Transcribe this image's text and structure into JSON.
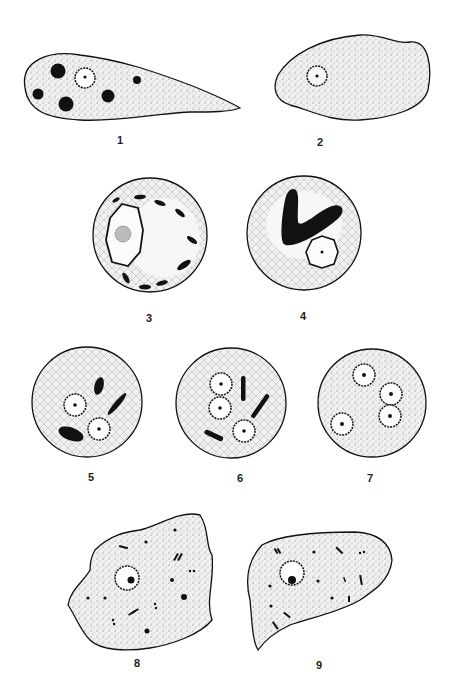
{
  "plate": {
    "type": "scientific illustration plate",
    "figures": [
      {
        "id": 1,
        "label": "1",
        "shape": "elongated amoeba with tapering tail",
        "nucleus": 1,
        "inclusions": "5 dark round bodies"
      },
      {
        "id": 2,
        "label": "2",
        "shape": "irregular amoeba",
        "nucleus": 1
      },
      {
        "id": 3,
        "label": "3",
        "shape": "round cyst",
        "nucleus": 1,
        "inclusions": "peripheral dark rods"
      },
      {
        "id": 4,
        "label": "4",
        "shape": "round cyst",
        "nucleus": 1,
        "inclusions": "large V-shaped dark body"
      },
      {
        "id": 5,
        "label": "5",
        "shape": "round cyst",
        "nucleus": 2,
        "inclusions": "3 dark bodies"
      },
      {
        "id": 6,
        "label": "6",
        "shape": "round cyst",
        "nucleus": 3,
        "inclusions": "3 dark rods"
      },
      {
        "id": 7,
        "label": "7",
        "shape": "round cyst",
        "nucleus": 4
      },
      {
        "id": 8,
        "label": "8",
        "shape": "irregular amoeba",
        "nucleus": 1,
        "inclusions": "scattered granules"
      },
      {
        "id": 9,
        "label": "9",
        "shape": "irregular amoeba",
        "nucleus": 1,
        "inclusions": "scattered granules and rods"
      }
    ]
  },
  "colors": {
    "ink": "#111111",
    "fill": "#ecebe8",
    "paper": "#ffffff"
  }
}
